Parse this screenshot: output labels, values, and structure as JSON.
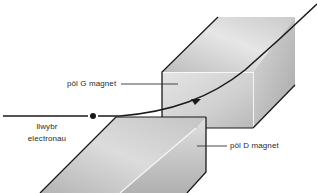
{
  "diagram": {
    "labels": {
      "north_pole": "pôl G magnet",
      "south_pole": "pôl D magnet",
      "electron_path_line1": "llwybr",
      "electron_path_line2": "electronau"
    },
    "colors": {
      "outline": "#1a1a1a",
      "face_light": "#f2f2f2",
      "face_mid": "#cfcfcf",
      "face_dark": "#a9a9a9",
      "text": "#2a2a2a"
    }
  }
}
